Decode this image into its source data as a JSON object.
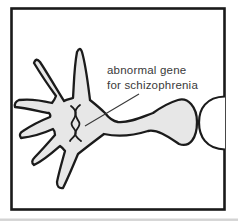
{
  "diagram": {
    "label": {
      "line1": "abnormal gene",
      "line2": "for schizophrenia"
    },
    "colors": {
      "background": "#ffffff",
      "frame": "#1a1a1a",
      "cell_fill": "#e7e7e7",
      "cell_outline": "#1b1b1b",
      "adjacent_cell_fill": "#ffffff",
      "leader_line": "#3a3a3a",
      "text": "#3a3a3a",
      "page_edge_shadow": "#c4c4c4"
    }
  }
}
